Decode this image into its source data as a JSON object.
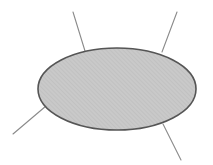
{
  "canvas": {
    "width": 213,
    "height": 165,
    "background_color": "#ffffff"
  },
  "figure": {
    "shape_type": "ellipse",
    "ellipse": {
      "center_x": 117,
      "center_y": 89,
      "radius_x": 79,
      "radius_y": 41,
      "fill_color": "#c9c9c9",
      "hatch_color": "#bdbdbd",
      "hatch_direction": "forward-slash",
      "hatch_spacing": 3,
      "stroke_color": "#555555",
      "stroke_width": 1.6
    },
    "lines": [
      {
        "name": "top-left-line",
        "x1": 73,
        "y1": 12,
        "x2": 85,
        "y2": 51,
        "stroke_color": "#8a8a8a",
        "stroke_width": 1.1
      },
      {
        "name": "top-right-line",
        "x1": 177,
        "y1": 12,
        "x2": 162,
        "y2": 52,
        "stroke_color": "#8a8a8a",
        "stroke_width": 1.1
      },
      {
        "name": "bottom-left-line",
        "x1": 46,
        "y1": 106,
        "x2": 13,
        "y2": 134,
        "stroke_color": "#8a8a8a",
        "stroke_width": 1.1
      },
      {
        "name": "bottom-right-line",
        "x1": 163,
        "y1": 124,
        "x2": 181,
        "y2": 160,
        "stroke_color": "#8a8a8a",
        "stroke_width": 1.1
      }
    ]
  }
}
